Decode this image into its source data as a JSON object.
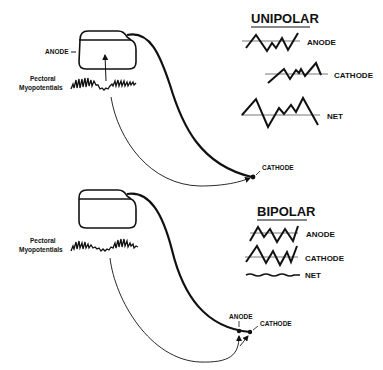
{
  "colors": {
    "ink": "#111111",
    "background": "#ffffff",
    "baseline": "#555555"
  },
  "unipolar": {
    "heading": "UNIPOLAR",
    "device_label": "ANODE",
    "myopotential_label_line1": "Pectoral",
    "myopotential_label_line2": "Myopotentials",
    "lead_tip_label": "CATHODE",
    "legend": [
      {
        "label": "ANODE",
        "waveform": "large-amplitude zigzag"
      },
      {
        "label": "CATHODE",
        "waveform": "small-amplitude zigzag"
      },
      {
        "label": "NET",
        "waveform": "large-amplitude combined zigzag"
      }
    ]
  },
  "bipolar": {
    "heading": "BIPOLAR",
    "myopotential_label_line1": "Pectoral",
    "myopotential_label_line2": "Myopotentials",
    "lead_anode_label": "ANODE",
    "lead_cathode_label": "CATHODE",
    "legend": [
      {
        "label": "ANODE",
        "waveform": "zigzag"
      },
      {
        "label": "CATHODE",
        "waveform": "zigzag (similar)"
      },
      {
        "label": "NET",
        "waveform": "nearly flat wavy line"
      }
    ]
  }
}
